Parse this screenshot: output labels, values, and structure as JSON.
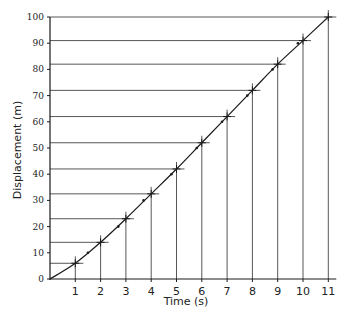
{
  "chart_data": {
    "type": "line",
    "title": "",
    "xlabel": "Time (s)",
    "ylabel": "Displacement (m)",
    "xlim": [
      0,
      11
    ],
    "ylim": [
      0,
      100
    ],
    "x_ticks": [
      1,
      2,
      3,
      4,
      5,
      6,
      7,
      8,
      9,
      10,
      11
    ],
    "y_ticks": [
      0,
      10,
      20,
      30,
      40,
      50,
      60,
      70,
      80,
      90,
      100
    ],
    "grid": false,
    "legend": null,
    "series": [
      {
        "name": "Displacement curve",
        "x": [
          0,
          1,
          2,
          3,
          4,
          5,
          6,
          7,
          8,
          9,
          10,
          11
        ],
        "values": [
          0,
          6,
          14,
          23,
          32.5,
          42,
          52,
          62,
          72,
          82,
          91,
          100
        ]
      }
    ],
    "intermediate_points": {
      "x": [
        1.5,
        2.7,
        3.7,
        4.8,
        5.8,
        6.8,
        7.8,
        8.8,
        9.8
      ],
      "values": [
        10,
        20,
        30,
        40,
        50,
        60,
        70,
        80,
        90
      ]
    },
    "annotations": "Vertical drop-lines from each whole-second point to the time axis and horizontal lines to the displacement axis; crosses mark each whole-second reading."
  },
  "axes": {
    "x_label": "Time (s)",
    "y_label": "Displacement (m)",
    "x_tick_labels": [
      "1",
      "2",
      "3",
      "4",
      "5",
      "6",
      "7",
      "8",
      "9",
      "10",
      "11"
    ],
    "y_tick_labels": [
      "0",
      "10",
      "20",
      "30",
      "40",
      "50",
      "60",
      "70",
      "80",
      "90",
      "100"
    ]
  },
  "colors": {
    "line": "#1a1a1a",
    "guide": "#444444",
    "background": "#ffffff"
  }
}
